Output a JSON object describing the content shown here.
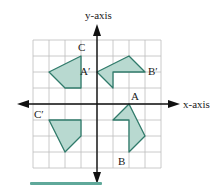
{
  "diagram": {
    "type": "coordinate-plane-rotation",
    "axes": {
      "x_label": "x-axis",
      "y_label": "y-axis"
    },
    "grid": {
      "x_range": [
        -4,
        4
      ],
      "y_range": [
        -4,
        4
      ],
      "cell_px": 16
    },
    "colors": {
      "fill": "#b8d9d0",
      "stroke": "#2f7a6a",
      "grid": "#bdbdbd",
      "axis": "#111111",
      "bar": "#5fa89a"
    },
    "polygons": [
      {
        "name": "figure-q4",
        "points": [
          [
            2,
            0
          ],
          [
            3,
            -2
          ],
          [
            2,
            -3
          ],
          [
            2,
            -1
          ],
          [
            1,
            -1
          ]
        ]
      },
      {
        "name": "figure-q1",
        "points": [
          [
            0,
            2
          ],
          [
            2,
            3
          ],
          [
            3,
            2
          ],
          [
            1,
            2
          ],
          [
            1,
            1
          ]
        ]
      },
      {
        "name": "figure-q2",
        "points": [
          [
            -3,
            2
          ],
          [
            -1,
            3
          ],
          [
            -1,
            1
          ],
          [
            -2,
            1
          ]
        ]
      },
      {
        "name": "figure-q3",
        "points": [
          [
            -3,
            -1
          ],
          [
            -1,
            -1
          ],
          [
            -1,
            -2
          ],
          [
            -2,
            -3
          ]
        ]
      }
    ],
    "labels": [
      {
        "text": "A",
        "at": [
          2,
          0
        ]
      },
      {
        "text": "B",
        "at": [
          2,
          -3
        ]
      },
      {
        "text": "C",
        "at": [
          -1,
          3
        ]
      },
      {
        "text": "A′",
        "at": [
          0,
          2
        ]
      },
      {
        "text": "B′",
        "at": [
          3,
          2
        ]
      },
      {
        "text": "C′",
        "at": [
          -3,
          -1
        ]
      }
    ]
  }
}
